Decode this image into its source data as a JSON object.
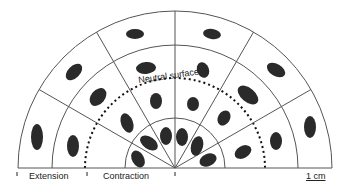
{
  "diagram": {
    "labels": {
      "neutral": "Neutral surface",
      "extension": "Extension",
      "contraction": "Contraction",
      "scale": "1 cm"
    },
    "colors": {
      "line": "#555555",
      "cell": "#2a2a2a"
    },
    "geometry": {
      "cx": 175,
      "cy": 168,
      "radii": [
        157,
        123,
        50
      ],
      "neutral_radius": 90
    },
    "ellipses": [
      [
        135,
        34,
        9,
        5,
        0
      ],
      [
        212,
        34,
        9,
        5,
        10
      ],
      [
        74,
        72,
        10,
        6,
        -45
      ],
      [
        276,
        70,
        10,
        6,
        30
      ],
      [
        37,
        137,
        6,
        13,
        0
      ],
      [
        310,
        127,
        6,
        11,
        0
      ],
      [
        146,
        68,
        10,
        6,
        -5
      ],
      [
        203,
        70,
        6,
        8,
        -20
      ],
      [
        98,
        97,
        7,
        10,
        40
      ],
      [
        248,
        95,
        12,
        7,
        40
      ],
      [
        73,
        146,
        6,
        11,
        0
      ],
      [
        276,
        141,
        6,
        9,
        0
      ],
      [
        156,
        101,
        6,
        8,
        0
      ],
      [
        193,
        104,
        6,
        7,
        0
      ],
      [
        127,
        123,
        6,
        10,
        -20
      ],
      [
        224,
        118,
        6,
        8,
        30
      ],
      [
        243,
        152,
        9,
        6,
        -30
      ],
      [
        149,
        143,
        10,
        6,
        35
      ],
      [
        166,
        136,
        6,
        9,
        0
      ],
      [
        182,
        137,
        6,
        9,
        0
      ],
      [
        197,
        146,
        6,
        10,
        15
      ],
      [
        138,
        159,
        6,
        9,
        -30
      ],
      [
        208,
        160,
        9,
        6,
        -25
      ]
    ]
  }
}
